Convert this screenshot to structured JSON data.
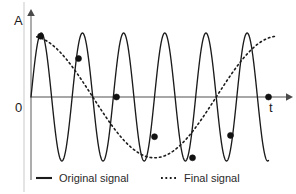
{
  "figure": {
    "title": "",
    "background_color": "#ffffff"
  },
  "axes": {
    "y_label": "A",
    "x_label": "t",
    "origin_label": "0",
    "axis_color": "#8a8a8a"
  },
  "legend": {
    "position": "bottom",
    "items": [
      {
        "label": "Original signal",
        "style": "solid",
        "color": "#1b1b1b"
      },
      {
        "label": "Final signal",
        "style": "dotted",
        "color": "#1b1b1b"
      }
    ]
  },
  "chart_data": {
    "type": "line",
    "title": "",
    "subtitle": "",
    "xlabel": "t",
    "ylabel": "A",
    "grid": false,
    "legend_position": "bottom",
    "xlim": [
      0,
      6.5
    ],
    "ylim": [
      -1.15,
      1.15
    ],
    "annotations": [
      "Aliasing illustration: a high-frequency sine sampled too slowly reconstructs as a low-frequency signal"
    ],
    "series": [
      {
        "name": "Original signal",
        "style": "solid",
        "color": "#1b1b1b",
        "description": "High frequency sine wave, 6 full cycles across the time axis, unit amplitude",
        "waveform": "sine",
        "cycles": 6,
        "amplitude": 1.0,
        "phase": 0,
        "x_start": 0,
        "x_end": 6.25
      },
      {
        "name": "Final signal",
        "style": "dotted",
        "color": "#1b1b1b",
        "description": "Low frequency aliased cosine reconstructed from the sample points, one cycle across the axis",
        "waveform": "cosine",
        "cycles": 1,
        "amplitude": 0.95,
        "phase": 0,
        "x_start": 0.15,
        "x_end": 6.45
      }
    ],
    "sample_points": {
      "name": "Sample instants",
      "marker": "filled-square-dot",
      "color": "#111111",
      "count": 7,
      "x": [
        0.25,
        1.25,
        2.25,
        3.25,
        4.25,
        5.25,
        6.25
      ],
      "y": [
        0.95,
        0.6,
        0.0,
        -0.62,
        -0.95,
        -0.6,
        0.0
      ]
    }
  }
}
